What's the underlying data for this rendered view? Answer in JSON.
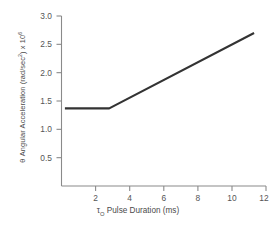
{
  "chart_data": {
    "type": "line",
    "title": "",
    "xlabel": "τ₀ Pulse Duration (ms)",
    "xlabel_base": "τ",
    "xlabel_sub": "O",
    "xlabel_rest": " Pulse Duration (ms)",
    "ylabel": "θ Angular Acceleration (rad/sec²) x 10⁶",
    "ylabel_theta": "θ",
    "ylabel_main": " Angular Acceleration (rad/sec",
    "ylabel_sup1": "2",
    "ylabel_mid": ") x 10",
    "ylabel_sup2": "6",
    "xlim": [
      0,
      12
    ],
    "ylim": [
      0,
      3.0
    ],
    "xticks": [
      2,
      4,
      6,
      8,
      10,
      12
    ],
    "xtick_labels": [
      "2",
      "4",
      "6",
      "8",
      "10",
      "12"
    ],
    "yticks": [
      0.5,
      1.0,
      1.5,
      2.0,
      2.5,
      3.0
    ],
    "ytick_labels": [
      "0.5",
      "1.0",
      "1.5",
      "2.0",
      "2.5",
      "3.0"
    ],
    "grid": false,
    "legend": false,
    "series": [
      {
        "name": "angular-acceleration",
        "color": "#333333",
        "x": [
          0.2,
          2.8,
          11.3
        ],
        "values": [
          1.37,
          1.37,
          2.7
        ]
      }
    ],
    "breakpoint": {
      "x": 2.8,
      "y": 1.37
    },
    "plateau_value": 1.37,
    "end_value": 2.7
  },
  "caption": "",
  "axis_color": "#8a8a8a",
  "text_color": "#4a4a4a"
}
